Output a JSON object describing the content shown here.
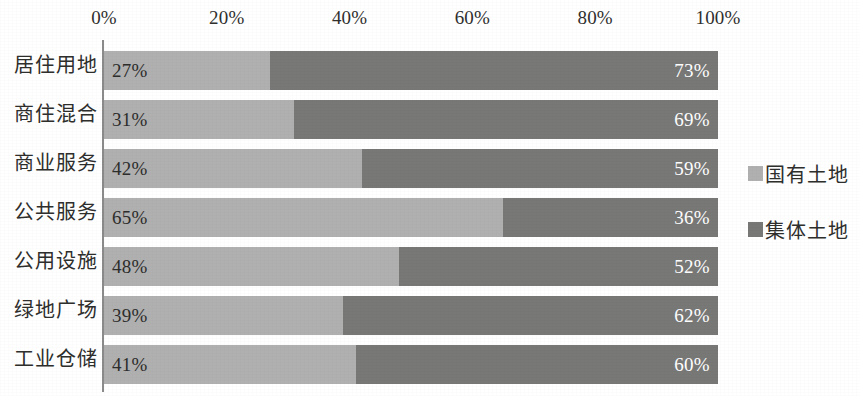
{
  "chart_data": {
    "type": "bar",
    "orientation": "horizontal",
    "stacked": true,
    "normalized_percent": true,
    "title": "",
    "subtitle": "",
    "xlabel": "",
    "ylabel": "",
    "xlim": [
      0,
      100
    ],
    "grid": false,
    "legend_position": "right",
    "x_tick_labels": [
      "0%",
      "20%",
      "40%",
      "60%",
      "80%",
      "100%"
    ],
    "x_tick_values": [
      0,
      20,
      40,
      60,
      80,
      100
    ],
    "categories": [
      "居住用地",
      "商住混合",
      "商业服务",
      "公共服务",
      "公用设施",
      "绿地广场",
      "工业仓储"
    ],
    "series": [
      {
        "name": "国有土地",
        "color": "#b0b0b0",
        "values": [
          27,
          31,
          42,
          65,
          48,
          39,
          41
        ],
        "labels": [
          "27%",
          "31%",
          "42%",
          "65%",
          "48%",
          "39%",
          "41%"
        ]
      },
      {
        "name": "集体土地",
        "color": "#787877",
        "values": [
          73,
          69,
          59,
          36,
          52,
          62,
          60
        ],
        "labels": [
          "73%",
          "69%",
          "59%",
          "36%",
          "52%",
          "62%",
          "60%"
        ]
      }
    ]
  },
  "legend": {
    "items": [
      {
        "label": "国有土地",
        "color": "#b0b0b0"
      },
      {
        "label": "集体土地",
        "color": "#787877"
      }
    ]
  },
  "colors": {
    "series_state_owned": "#b0b0b0",
    "series_collective": "#787877",
    "axis": "#8a8a8a",
    "text": "#2e2e2d",
    "value_label_on_dark": "#ffffff",
    "background": "#ffffff"
  }
}
